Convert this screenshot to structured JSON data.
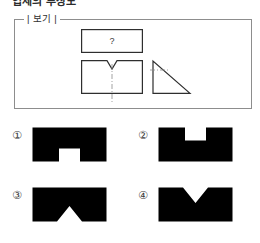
{
  "page": {
    "title_partial": "입체의 투상도",
    "background_color": "#ffffff",
    "line_color": "#2e2e2e",
    "center_line_color": "#8a8a8a"
  },
  "example": {
    "legend": "| 보기 |",
    "question_symbol": "?",
    "figures": [
      {
        "name": "top-view-unknown",
        "shape": "rectangle",
        "label": "?"
      },
      {
        "name": "front-view-v-notch",
        "shape": "rectangle-with-top-v-notch"
      },
      {
        "name": "side-view-right-triangle",
        "shape": "right-triangle"
      }
    ]
  },
  "options": [
    {
      "number": "①",
      "name": "option-1",
      "shape": "rectangle-with-bottom-rectangular-notch"
    },
    {
      "number": "②",
      "name": "option-2",
      "shape": "rectangle-with-top-rectangular-notch"
    },
    {
      "number": "③",
      "name": "option-3",
      "shape": "rectangle-with-bottom-triangular-peak"
    },
    {
      "number": "④",
      "name": "option-4",
      "shape": "rectangle-with-top-v-notch"
    }
  ]
}
